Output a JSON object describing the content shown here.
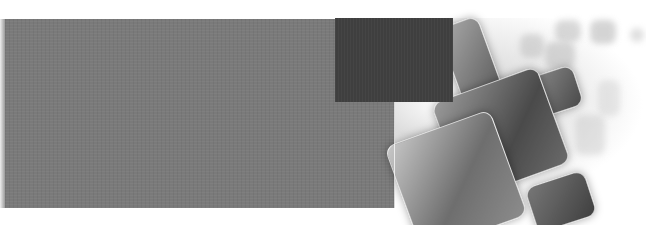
{
  "banner": {
    "description": "decorative abstract banner",
    "colors": {
      "gray_panel": "#7a7a7a",
      "dark_square": "#3f3f3f",
      "background": "#ffffff"
    },
    "graphic": "abstract-rounded-squares-graphic"
  }
}
